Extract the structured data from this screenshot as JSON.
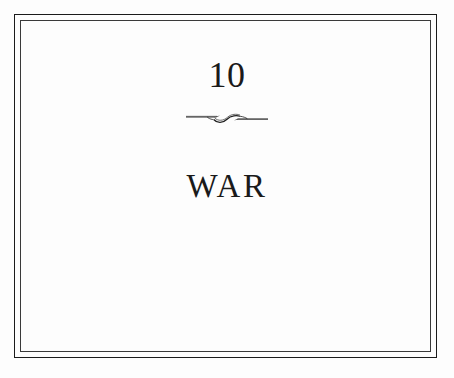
{
  "page": {
    "background_color": "#fdfdfd",
    "ink_color": "#1a1a1a",
    "kind": "book-chapter-opening-page"
  },
  "frame": {
    "style": "double-rule-border",
    "outer_color": "#1b1b1b",
    "inner_color": "#3a3a3a"
  },
  "chapter": {
    "number": "10",
    "title": "WAR",
    "ornament_name": "swash-rule-ornament"
  }
}
